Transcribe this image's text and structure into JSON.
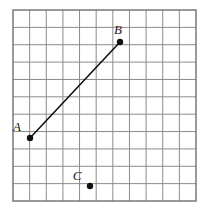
{
  "figure": {
    "kind": "coordinate-grid-diagram",
    "title": "",
    "background_color": "#ffffff",
    "grid": {
      "line_color": "#8c8c8c",
      "border_color": "#6e6e6e",
      "line_width": 1,
      "border_width": 1.4,
      "columns": 11,
      "rows": 11,
      "cell_size_px": 16.6,
      "origin_x_px": 13,
      "origin_y_px": 10,
      "width_px": 183,
      "height_px": 191
    },
    "points": [
      {
        "id": "A",
        "label": "A",
        "x_px": 30,
        "y_px": 138,
        "grid_col": 1,
        "grid_row": 7.7,
        "dot_radius_px": 3.2,
        "color": "#111111",
        "label_dx_px": -13,
        "label_dy_px": -7
      },
      {
        "id": "B",
        "label": "B",
        "x_px": 120,
        "y_px": 42,
        "grid_col": 6.4,
        "grid_row": 1.9,
        "dot_radius_px": 3.2,
        "color": "#111111",
        "label_dx_px": -2,
        "label_dy_px": -8
      },
      {
        "id": "C",
        "label": "C",
        "x_px": 90,
        "y_px": 186,
        "grid_col": 4.6,
        "grid_row": 10.6,
        "dot_radius_px": 3.2,
        "color": "#111111",
        "label_dx_px": -13,
        "label_dy_px": -6
      }
    ],
    "segments": [
      {
        "id": "AB",
        "from": "A",
        "to": "B",
        "x1_px": 30,
        "y1_px": 138,
        "x2_px": 120,
        "y2_px": 42,
        "color": "#111111",
        "width_px": 1.6
      }
    ]
  }
}
